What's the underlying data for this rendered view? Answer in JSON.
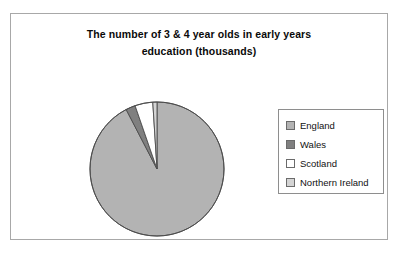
{
  "chart_data": {
    "type": "pie",
    "title": "The number of 3 & 4 year olds in early years education (thousands)",
    "title_lines": [
      "The number of 3 & 4 year olds in early years",
      "education (thousands)"
    ],
    "xlabel": "",
    "ylabel": "",
    "grid": false,
    "legend_position": "right",
    "categories": [
      "England",
      "Wales",
      "Scotland",
      "Northern Ireland"
    ],
    "values": [
      1088,
      27,
      51,
      9
    ],
    "percentages": [
      92.4,
      2.3,
      4.3,
      0.8
    ],
    "colors": [
      "#b3b3b3",
      "#808080",
      "#ffffff",
      "#d4d4d4"
    ],
    "start_angle_deg": 0,
    "direction": "clockwise",
    "slices": [
      {
        "label": "England",
        "percent": 92.4,
        "color": "#b3b3b3",
        "start_deg": 0,
        "end_deg": 332.6
      },
      {
        "label": "Wales",
        "percent": 2.3,
        "color": "#808080",
        "start_deg": 332.6,
        "end_deg": 340.9
      },
      {
        "label": "Scotland",
        "percent": 4.3,
        "color": "#ffffff",
        "start_deg": 340.9,
        "end_deg": 356.4
      },
      {
        "label": "Northern Ireland",
        "percent": 0.8,
        "color": "#d4d4d4",
        "start_deg": 356.4,
        "end_deg": 360
      }
    ]
  },
  "legend": {
    "items": [
      {
        "label": "England",
        "color": "#b3b3b3"
      },
      {
        "label": "Wales",
        "color": "#808080"
      },
      {
        "label": "Scotland",
        "color": "#ffffff"
      },
      {
        "label": "Northern Ireland",
        "color": "#d4d4d4"
      }
    ]
  },
  "style": {
    "frame_border": "#a8a8a8",
    "pie_outline": "#4d4d4d",
    "background": "#ffffff"
  }
}
